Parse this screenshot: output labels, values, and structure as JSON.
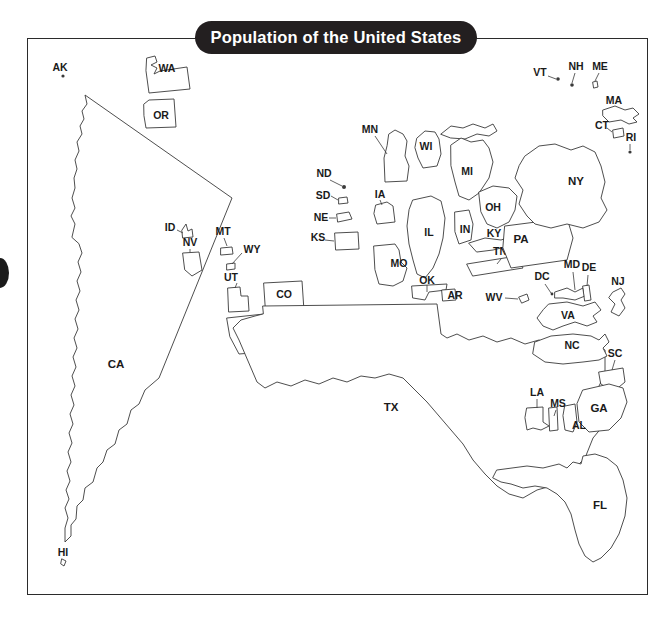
{
  "page": {
    "background_color": "#ffffff",
    "frame_color": "#2b2b2b"
  },
  "title_banner": {
    "text": "Population of the United States",
    "background_color": "#231f20",
    "text_color": "#ffffff"
  },
  "map": {
    "kind": "cartogram",
    "description": "Cartogram of the United States in which each state's drawn area is proportional to its population rather than its land area.",
    "outline_color": "#3a3a3a",
    "fill_color": "#ffffff",
    "labels": [
      {
        "code": "AK",
        "x": 33,
        "y": 30
      },
      {
        "code": "WA",
        "x": 140,
        "y": 31
      },
      {
        "code": "OR",
        "x": 134,
        "y": 78
      },
      {
        "code": "CA",
        "x": 89,
        "y": 327
      },
      {
        "code": "HI",
        "x": 36,
        "y": 515
      },
      {
        "code": "ID",
        "x": 143,
        "y": 190
      },
      {
        "code": "NV",
        "x": 163,
        "y": 205
      },
      {
        "code": "MT",
        "x": 196,
        "y": 194
      },
      {
        "code": "WY",
        "x": 225,
        "y": 212
      },
      {
        "code": "UT",
        "x": 204,
        "y": 240
      },
      {
        "code": "CO",
        "x": 257,
        "y": 257
      },
      {
        "code": "AZ",
        "x": 219,
        "y": 295
      },
      {
        "code": "NM",
        "x": 254,
        "y": 286
      },
      {
        "code": "ND",
        "x": 297,
        "y": 136
      },
      {
        "code": "SD",
        "x": 296,
        "y": 158
      },
      {
        "code": "NE",
        "x": 294,
        "y": 180
      },
      {
        "code": "KS",
        "x": 291,
        "y": 200
      },
      {
        "code": "MN",
        "x": 343,
        "y": 92
      },
      {
        "code": "IA",
        "x": 353,
        "y": 157
      },
      {
        "code": "MO",
        "x": 372,
        "y": 226
      },
      {
        "code": "WI",
        "x": 399,
        "y": 109
      },
      {
        "code": "IL",
        "x": 402,
        "y": 195
      },
      {
        "code": "MI",
        "x": 440,
        "y": 134
      },
      {
        "code": "IN",
        "x": 438,
        "y": 192
      },
      {
        "code": "OH",
        "x": 466,
        "y": 170
      },
      {
        "code": "KY",
        "x": 467,
        "y": 196
      },
      {
        "code": "TN",
        "x": 473,
        "y": 214
      },
      {
        "code": "OK",
        "x": 400,
        "y": 243
      },
      {
        "code": "AR",
        "x": 428,
        "y": 258
      },
      {
        "code": "TX",
        "x": 364,
        "y": 370
      },
      {
        "code": "WV",
        "x": 467,
        "y": 260
      },
      {
        "code": "PA",
        "x": 494,
        "y": 202
      },
      {
        "code": "NY",
        "x": 549,
        "y": 144
      },
      {
        "code": "VT",
        "x": 513,
        "y": 35
      },
      {
        "code": "NH",
        "x": 549,
        "y": 29
      },
      {
        "code": "ME",
        "x": 573,
        "y": 29
      },
      {
        "code": "MA",
        "x": 587,
        "y": 63
      },
      {
        "code": "CT",
        "x": 575,
        "y": 88
      },
      {
        "code": "RI",
        "x": 604,
        "y": 100
      },
      {
        "code": "NJ",
        "x": 591,
        "y": 244
      },
      {
        "code": "DE",
        "x": 562,
        "y": 230
      },
      {
        "code": "MD",
        "x": 545,
        "y": 227
      },
      {
        "code": "DC",
        "x": 515,
        "y": 239
      },
      {
        "code": "VA",
        "x": 541,
        "y": 278
      },
      {
        "code": "NC",
        "x": 545,
        "y": 308
      },
      {
        "code": "SC",
        "x": 588,
        "y": 316
      },
      {
        "code": "GA",
        "x": 572,
        "y": 371
      },
      {
        "code": "AL",
        "x": 552,
        "y": 388
      },
      {
        "code": "MS",
        "x": 531,
        "y": 366
      },
      {
        "code": "LA",
        "x": 510,
        "y": 355
      },
      {
        "code": "FL",
        "x": 573,
        "y": 468
      }
    ]
  }
}
